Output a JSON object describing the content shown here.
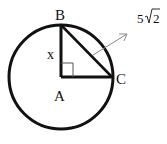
{
  "diagram": {
    "type": "geometry",
    "circle": {
      "center_label": "A",
      "cx": 61,
      "cy": 77,
      "r": 52
    },
    "points": {
      "A": {
        "label": "A",
        "x": 61,
        "y": 77
      },
      "B": {
        "label": "B",
        "x": 61,
        "y": 25
      },
      "C": {
        "label": "C",
        "x": 112,
        "y": 77
      }
    },
    "segments": [
      {
        "from": "A",
        "to": "B",
        "label": "x"
      },
      {
        "from": "A",
        "to": "C"
      },
      {
        "from": "B",
        "to": "C"
      }
    ],
    "right_angle_at": "A",
    "arrow_annotation": {
      "label": "5√2",
      "points_to": "BC"
    }
  },
  "labels": {
    "A": "A",
    "B": "B",
    "C": "C",
    "x": "x",
    "hyp_coef": "5",
    "hyp_radicand": "2"
  },
  "colors": {
    "stroke": "#111111",
    "arrow": "#888888",
    "background": "#ffffff"
  }
}
